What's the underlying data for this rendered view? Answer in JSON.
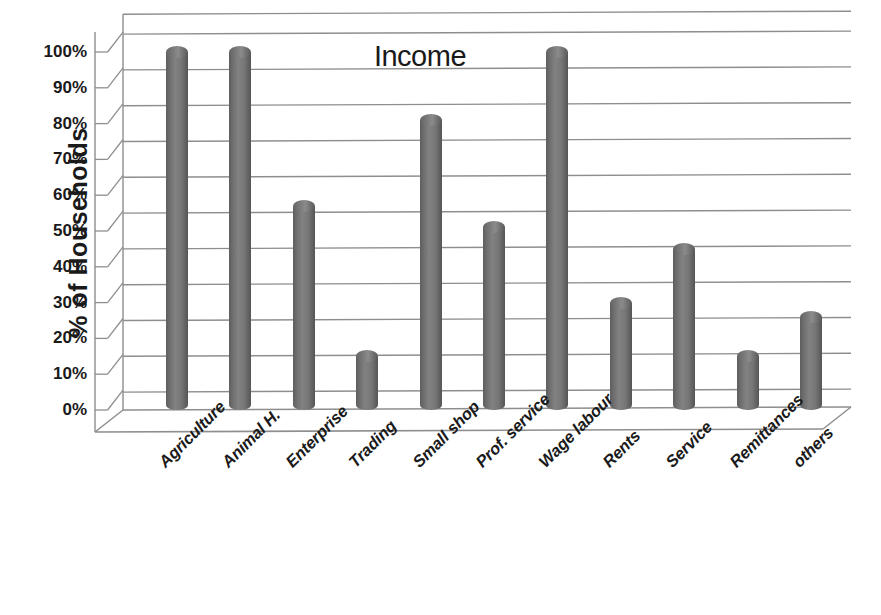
{
  "chart_data": {
    "type": "bar",
    "title": "Income",
    "xlabel": "",
    "ylabel": "% of Households",
    "categories": [
      "Agriculture",
      "Animal H.",
      "Enterprise",
      "Trading",
      "Small shop",
      "Prof. service",
      "Wage labour",
      "Rents",
      "Service",
      "Remittances",
      "others"
    ],
    "values": [
      100,
      100,
      57,
      15,
      81,
      51,
      100,
      30,
      45,
      15,
      26
    ],
    "ylim": [
      0,
      100
    ],
    "ytick_labels": [
      "0%",
      "10%",
      "20%",
      "30%",
      "40%",
      "50%",
      "60%",
      "70%",
      "80%",
      "90%",
      "100%"
    ],
    "ytick_values": [
      0,
      10,
      20,
      30,
      40,
      50,
      60,
      70,
      80,
      90,
      100
    ],
    "grid": true,
    "legend": "none",
    "bar_color": "#707070",
    "style_3d": true
  },
  "axis": {
    "y_title": "% of Households"
  }
}
